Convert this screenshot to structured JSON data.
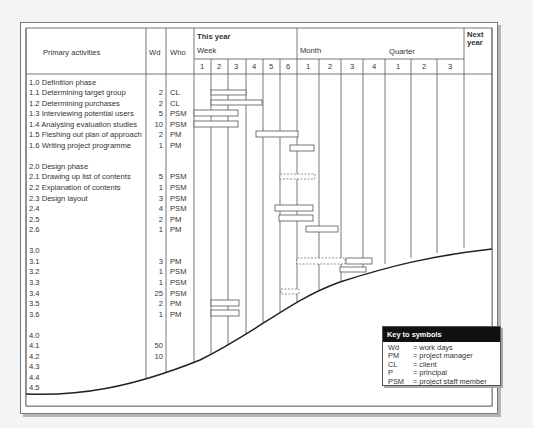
{
  "header": {
    "activities_label": "Primary activities",
    "wd_label": "Wd",
    "who_label": "Who",
    "this_year_label": "This year",
    "week_label": "Week",
    "month_label": "Month",
    "quarter_label": "Quarter",
    "next_year_label": "Next year",
    "week_numbers": [
      "1",
      "2",
      "3",
      "4",
      "5",
      "6"
    ],
    "month_numbers": [
      "1",
      "2",
      "3",
      "4"
    ],
    "quarter_numbers": [
      "1",
      "2",
      "3"
    ]
  },
  "rows": [
    {
      "activity": "1.0 Definition phase",
      "wd": "",
      "who": ""
    },
    {
      "activity": "1.1 Determining target group",
      "wd": "2",
      "who": "CL"
    },
    {
      "activity": "1.2 Determining purchases",
      "wd": "2",
      "who": "CL"
    },
    {
      "activity": "1.3 Interviewing potential users",
      "wd": "5",
      "who": "PSM"
    },
    {
      "activity": "1.4 Analysing evaluation studies",
      "wd": "10",
      "who": "PSM"
    },
    {
      "activity": "1.5 Fleshing out plan of approach",
      "wd": "2",
      "who": "PM"
    },
    {
      "activity": "1.6 Writing project programme",
      "wd": "1",
      "who": "PM"
    },
    {
      "activity": "",
      "wd": "",
      "who": ""
    },
    {
      "activity": "2.0 Design phase",
      "wd": "",
      "who": ""
    },
    {
      "activity": "2.1 Drawing up list of contents",
      "wd": "5",
      "who": "PSM"
    },
    {
      "activity": "2.2 Explanation of contents",
      "wd": "1",
      "who": "PSM"
    },
    {
      "activity": "2.3 Design layout",
      "wd": "3",
      "who": "PSM"
    },
    {
      "activity": "2.4",
      "wd": "4",
      "who": "PSM"
    },
    {
      "activity": "2.5",
      "wd": "2",
      "who": "PM"
    },
    {
      "activity": "2.6",
      "wd": "1",
      "who": "PM"
    },
    {
      "activity": "",
      "wd": "",
      "who": ""
    },
    {
      "activity": "3.0",
      "wd": "",
      "who": ""
    },
    {
      "activity": "3.1",
      "wd": "3",
      "who": "PM"
    },
    {
      "activity": "3.2",
      "wd": "1",
      "who": "PSM"
    },
    {
      "activity": "3.3",
      "wd": "1",
      "who": "PSM"
    },
    {
      "activity": "3.4",
      "wd": "25",
      "who": "PSM"
    },
    {
      "activity": "3.5",
      "wd": "2",
      "who": "PM"
    },
    {
      "activity": "3.6",
      "wd": "1",
      "who": "PM"
    },
    {
      "activity": "",
      "wd": "",
      "who": ""
    },
    {
      "activity": "4.0",
      "wd": "",
      "who": ""
    },
    {
      "activity": "4.1",
      "wd": "50",
      "who": ""
    },
    {
      "activity": "4.2",
      "wd": "10",
      "who": ""
    },
    {
      "activity": "4.3",
      "wd": "",
      "who": ""
    },
    {
      "activity": "4.4",
      "wd": "",
      "who": ""
    },
    {
      "activity": "4.5",
      "wd": "",
      "who": ""
    }
  ],
  "key": {
    "title": "Key to symbols",
    "items": [
      {
        "abbr": "Wd",
        "meaning": "= work days"
      },
      {
        "abbr": "PM",
        "meaning": "= project manager"
      },
      {
        "abbr": "CL",
        "meaning": "= client"
      },
      {
        "abbr": "P",
        "meaning": "= principal"
      },
      {
        "abbr": "PSM",
        "meaning": "= project staff member"
      }
    ]
  },
  "colors": {
    "line": "#555555",
    "bar_fill": "#ffffff",
    "curve": "#222222",
    "key_header_bg": "#111111"
  }
}
